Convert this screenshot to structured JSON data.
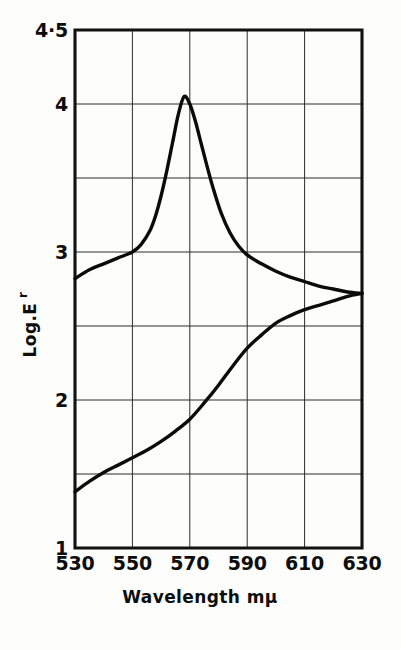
{
  "figure": {
    "background_color": "#fdfdfb",
    "ink_color": "#0b0b0b",
    "grid_color": "#2b2b2b"
  },
  "chart_data": {
    "type": "line",
    "title": "",
    "subtitle": "",
    "xlabel": "Wavelength  mμ",
    "ylabel": "Log.E",
    "ylabel_subscript": "r",
    "xlim": [
      530,
      630
    ],
    "ylim": [
      1,
      4.5
    ],
    "grid": true,
    "legend": "none",
    "x_ticks": [
      530,
      550,
      570,
      590,
      610,
      630
    ],
    "x_tick_labels": [
      "530",
      "550",
      "570",
      "590",
      "610",
      "630"
    ],
    "y_ticks": [
      1,
      2,
      3,
      4,
      4.5
    ],
    "y_tick_labels": [
      "1",
      "2",
      "3",
      "4",
      "4·5"
    ],
    "x_gridlines": [
      550,
      570,
      590,
      610
    ],
    "y_gridlines": [
      1.5,
      2.0,
      2.5,
      3.0,
      3.5,
      4.0
    ],
    "series": [
      {
        "name": "upper-peak-curve",
        "x": [
          530,
          535,
          540,
          545,
          550,
          553,
          556,
          558,
          560,
          562,
          564,
          566,
          568,
          570,
          572,
          574,
          576,
          578,
          581,
          584,
          587,
          590,
          595,
          600,
          605,
          610,
          615,
          620,
          625,
          630
        ],
        "values": [
          2.82,
          2.88,
          2.92,
          2.96,
          3.0,
          3.05,
          3.14,
          3.24,
          3.38,
          3.55,
          3.74,
          3.93,
          4.05,
          4.0,
          3.88,
          3.73,
          3.58,
          3.44,
          3.26,
          3.13,
          3.04,
          2.98,
          2.92,
          2.87,
          2.83,
          2.8,
          2.77,
          2.75,
          2.73,
          2.72
        ]
      },
      {
        "name": "lower-rising-curve",
        "x": [
          530,
          535,
          540,
          545,
          550,
          555,
          560,
          565,
          570,
          575,
          580,
          585,
          590,
          595,
          600,
          605,
          610,
          615,
          620,
          625,
          630
        ],
        "values": [
          1.38,
          1.45,
          1.51,
          1.56,
          1.61,
          1.66,
          1.72,
          1.79,
          1.87,
          1.98,
          2.1,
          2.23,
          2.35,
          2.44,
          2.52,
          2.57,
          2.61,
          2.64,
          2.67,
          2.7,
          2.72
        ]
      }
    ],
    "annotations": {
      "peak_wavelength": 568,
      "peak_value": 4.05,
      "convergence_wavelength": 630,
      "convergence_value": 2.72
    }
  }
}
